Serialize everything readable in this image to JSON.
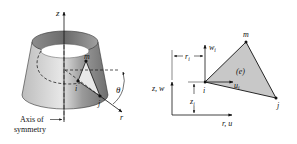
{
  "left_figure": {
    "axis_z_label": "z",
    "node_m": "m",
    "node_i": "i",
    "node_j": "j",
    "angle_label": "θ",
    "axis_r_label": "r",
    "axis_caption_line1": "Axis of",
    "axis_caption_line2": "symmetry"
  },
  "right_figure": {
    "axis_vertical_label": "z, w",
    "axis_horizontal_label": "r, u",
    "node_m": "m",
    "node_i": "i",
    "node_j": "j",
    "element_label": "(e)",
    "disp_w": "w",
    "disp_w_sub": "i",
    "disp_u": "u",
    "disp_u_sub": "i",
    "dim_r": "r",
    "dim_r_sub": "i",
    "dim_z": "z",
    "dim_z_sub": "i"
  },
  "colors": {
    "surface_light": "#d9d9d9",
    "surface_dark": "#8a8a8a",
    "element_fill": "#c8c8c8",
    "ink": "#111111"
  }
}
